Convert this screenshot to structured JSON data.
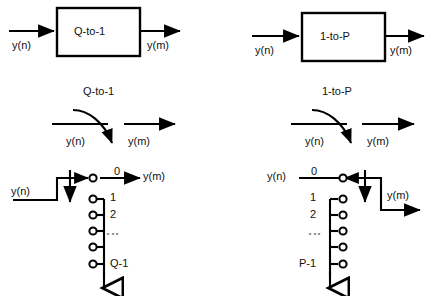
{
  "figure": {
    "title_hidden": "",
    "stroke_color": "#000000",
    "background": "#ffffff"
  },
  "panels": {
    "block_left": {
      "box_label": "Q-to-1",
      "input_label": "y(n)",
      "output_label": "y(m)"
    },
    "block_right": {
      "box_label": "1-to-P",
      "input_label": "y(n)",
      "output_label": "y(m)"
    },
    "switch_left": {
      "rate_label": "Q-to-1",
      "input_label": "y(n)",
      "output_label": "y(m)"
    },
    "switch_right": {
      "rate_label": "1-to-P",
      "input_label": "y(n)",
      "output_label": "y(m)"
    },
    "commutator_left": {
      "input_label": "y(n)",
      "output_label": "y(m)",
      "terminals": [
        "0",
        "1",
        "2",
        "⋮",
        "Q-1"
      ],
      "terminal_count_drawn": 6
    },
    "commutator_right": {
      "input_label": "y(n)",
      "output_label": "y(m)",
      "terminals": [
        "0",
        "1",
        "2",
        "⋮",
        "P-1"
      ],
      "terminal_count_drawn": 6
    }
  }
}
